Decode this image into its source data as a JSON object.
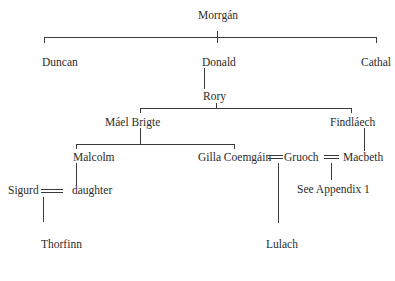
{
  "diagram": {
    "type": "family-tree",
    "people": {
      "morrgan": "Morrgán",
      "duncan": "Duncan",
      "donald": "Donald",
      "cathal": "Cathal",
      "rory": "Rory",
      "mael_brigte": "Máel Brigte",
      "findlaech": "Findláech",
      "malcolm": "Malcolm",
      "gilla_coemgain": "Gilla Coemgáin",
      "gruoch": "Gruoch",
      "macbeth": "Macbeth",
      "sigurd": "Sigurd",
      "daughter": "daughter",
      "see_appendix": "See Appendix 1",
      "thorfinn": "Thorfinn",
      "lulach": "Lulach"
    },
    "relationships": [
      {
        "type": "children",
        "parent": "Morrgán",
        "children": [
          "Duncan",
          "Donald",
          "Cathal"
        ]
      },
      {
        "type": "children",
        "parent": "Donald",
        "children": [
          "Rory"
        ]
      },
      {
        "type": "children",
        "parent": "Rory",
        "children": [
          "Máel Brigte",
          "Findláech"
        ]
      },
      {
        "type": "children",
        "parent": "Máel Brigte",
        "children": [
          "Malcolm",
          "Gilla Coemgáin"
        ]
      },
      {
        "type": "children",
        "parent": "Findláech",
        "children": [
          "Macbeth"
        ]
      },
      {
        "type": "marriage",
        "spouses": [
          "Gilla Coemgáin",
          "Gruoch"
        ]
      },
      {
        "type": "marriage",
        "spouses": [
          "Gruoch",
          "Macbeth"
        ]
      },
      {
        "type": "children",
        "parent": "Malcolm",
        "children": [
          "daughter"
        ]
      },
      {
        "type": "marriage",
        "spouses": [
          "Sigurd",
          "daughter"
        ]
      },
      {
        "type": "children",
        "parents": [
          "Sigurd",
          "daughter"
        ],
        "children": [
          "Thorfinn"
        ]
      },
      {
        "type": "children",
        "parents": [
          "Gilla Coemgáin",
          "Gruoch"
        ],
        "children": [
          "Lulach"
        ]
      },
      {
        "type": "reference",
        "parents": [
          "Gruoch",
          "Macbeth"
        ],
        "note": "See Appendix 1"
      }
    ]
  }
}
